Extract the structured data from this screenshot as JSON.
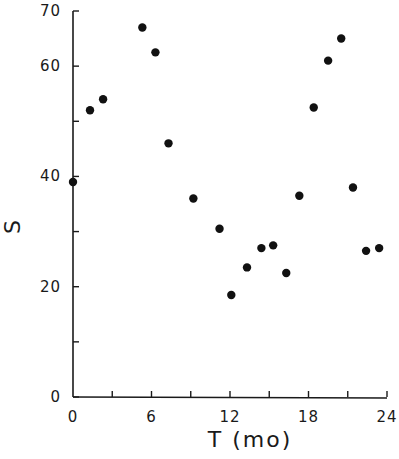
{
  "chart_data": {
    "type": "scatter",
    "title": "",
    "xlabel": "T (mo)",
    "ylabel": "S",
    "xlim": [
      0,
      24
    ],
    "ylim": [
      0,
      70
    ],
    "x_ticks": [
      0,
      3,
      6,
      9,
      12,
      15,
      18,
      21,
      24
    ],
    "x_tick_labels": [
      "0",
      "6",
      "12",
      "18",
      "24"
    ],
    "x_tick_label_values": [
      0,
      6,
      12,
      18,
      24
    ],
    "y_ticks": [
      0,
      10,
      20,
      30,
      40,
      50,
      60,
      70
    ],
    "y_tick_labels": [
      "0",
      "20",
      "40",
      "60",
      "70"
    ],
    "y_tick_label_values": [
      0,
      20,
      40,
      60,
      70
    ],
    "grid": false,
    "legend": null,
    "series": [
      {
        "name": "S",
        "marker": "filled-circle",
        "color": "#111111",
        "x": [
          0,
          1.3,
          2.3,
          5.3,
          6.3,
          7.3,
          9.2,
          11.2,
          12.1,
          13.3,
          14.4,
          15.3,
          16.3,
          17.3,
          18.4,
          19.5,
          20.5,
          21.4,
          22.4,
          23.4
        ],
        "y": [
          39,
          52,
          54,
          67,
          62.5,
          46,
          36,
          30.5,
          18.5,
          23.5,
          27,
          27.5,
          22.5,
          36.5,
          52.5,
          61,
          65,
          38,
          26.5,
          27
        ]
      }
    ]
  }
}
